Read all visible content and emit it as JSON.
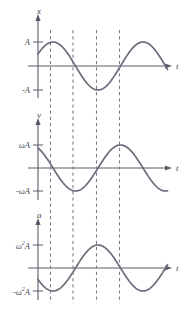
{
  "figure": {
    "background": "#ffffff",
    "curve_color": "#6b6b7b",
    "axis_color": "#5a5a66",
    "dashed_color": "#7a7a8c"
  },
  "panels": [
    {
      "id": "displacement",
      "y_axis_label": "x",
      "x_axis_label": "t",
      "ticks": [
        "A",
        "-A"
      ],
      "tick_positive": "A",
      "tick_negative": "-A"
    },
    {
      "id": "velocity",
      "y_axis_label": "v",
      "x_axis_label": "t",
      "ticks": [
        "ωA",
        "-ωA"
      ],
      "tick_positive": "ωA",
      "tick_negative": "-ωA"
    },
    {
      "id": "acceleration",
      "y_axis_label": "a",
      "x_axis_label": "t",
      "ticks": [
        "ω²A",
        "-ω²A"
      ],
      "tick_positive_base": "ω",
      "tick_positive_exp": "2",
      "tick_positive_tail": "A",
      "tick_negative_base": "-ω",
      "tick_negative_exp": "2",
      "tick_negative_tail": "A"
    }
  ],
  "chart_data": {
    "type": "line",
    "xlabel": "t",
    "ylabel": "",
    "grid": false,
    "legend": "none",
    "shared_x_markers": {
      "label": "vertical dashed guide lines at quarter-period instants",
      "t_values": [
        0.25,
        0.5,
        0.75,
        1.0
      ],
      "pixel_x": [
        50.5,
        73,
        96.5,
        119.5
      ],
      "style": "dashed"
    },
    "phase_offset_periods": 0.0833,
    "series": [
      {
        "name": "x",
        "ylabel": "x",
        "amplitude_label": "A",
        "ylim_labels": [
          "A",
          "-A"
        ],
        "formula": "x = A sin(2π(t + 0.0833))",
        "x": [
          0,
          0.0833,
          0.25,
          0.4167,
          0.5833,
          0.75,
          0.9167,
          1.0,
          1.0833,
          1.25
        ],
        "y": [
          0.5,
          0.866,
          1.0,
          0.5,
          -0.5,
          -1.0,
          -0.5,
          0.0,
          0.5,
          1.0
        ],
        "key_points": [
          {
            "t": 0.0,
            "value": 0.5,
            "note": "starts at half amplitude, rising"
          },
          {
            "t": 0.25,
            "value": 1.0,
            "note": "maximum A at first dashed line"
          },
          {
            "t": 0.5,
            "value": 0.0,
            "note": "zero crossing, falling"
          },
          {
            "t": 0.75,
            "value": -1.0,
            "note": "minimum -A at third dashed line"
          },
          {
            "t": 1.0,
            "value": 0.0,
            "note": "zero crossing, rising"
          }
        ]
      },
      {
        "name": "v",
        "ylabel": "v",
        "amplitude_label": "ωA",
        "ylim_labels": [
          "ωA",
          "-ωA"
        ],
        "formula": "v = ωA cos(2π(t + 0.0833))",
        "x": [
          0,
          0.0833,
          0.25,
          0.4167,
          0.5833,
          0.75,
          0.9167,
          1.0,
          1.0833,
          1.25
        ],
        "y": [
          0.866,
          0.5,
          0.0,
          -0.866,
          -1.0,
          0.0,
          0.866,
          1.0,
          0.866,
          0.0
        ],
        "key_points": [
          {
            "t": 0.0,
            "value": 0.866,
            "note": "starts near +ωA, falling"
          },
          {
            "t": 0.25,
            "value": 0.0,
            "note": "zero at first dashed line"
          },
          {
            "t": 0.5,
            "value": -1.0,
            "note": "minimum -ωA at second dashed line"
          },
          {
            "t": 0.75,
            "value": 0.0,
            "note": "zero at third dashed line"
          },
          {
            "t": 1.0,
            "value": 1.0,
            "note": "maximum ωA at fourth dashed line"
          }
        ]
      },
      {
        "name": "a",
        "ylabel": "a",
        "amplitude_label": "ω²A",
        "ylim_labels": [
          "ω²A",
          "-ω²A"
        ],
        "formula": "a = -ω²A sin(2π(t + 0.0833))",
        "x": [
          0,
          0.0833,
          0.25,
          0.4167,
          0.5833,
          0.75,
          0.9167,
          1.0,
          1.0833,
          1.25
        ],
        "y": [
          -0.5,
          -0.866,
          -1.0,
          -0.5,
          0.5,
          1.0,
          0.5,
          0.0,
          -0.5,
          -1.0
        ],
        "key_points": [
          {
            "t": 0.0,
            "value": -0.5,
            "note": "starts negative, falling"
          },
          {
            "t": 0.25,
            "value": -1.0,
            "note": "minimum -ω²A at first dashed line"
          },
          {
            "t": 0.5,
            "value": 0.0,
            "note": "zero crossing, rising"
          },
          {
            "t": 0.75,
            "value": 1.0,
            "note": "maximum ω²A at third dashed line"
          },
          {
            "t": 1.0,
            "value": 0.0,
            "note": "zero crossing, falling"
          }
        ]
      }
    ]
  }
}
